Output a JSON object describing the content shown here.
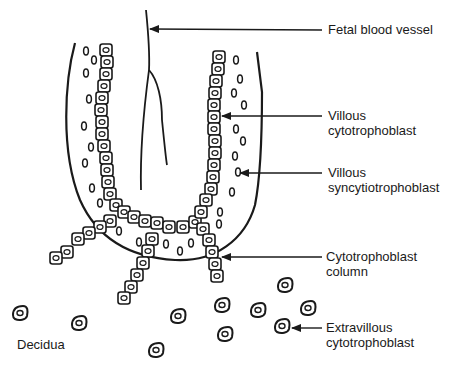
{
  "diagram": {
    "title": "",
    "colors": {
      "ink": "#1a1a1a",
      "background": "#ffffff"
    },
    "labels": {
      "fetal_blood_vessel": "Fetal blood vessel",
      "villous_cytotrophoblast": "Villous\ncytotrophoblast",
      "villous_syncytiotrophoblast": "Villous\nsyncytiotrophoblast",
      "cytotrophoblast_column": "Cytotrophoblast\ncolumn",
      "extravillous_cytotrophoblast": "Extravillous\ncytotrophoblast",
      "decidua": "Decidua"
    },
    "structures": [
      "villus-outline",
      "fetal-blood-vessel",
      "cytotrophoblast-layer",
      "syncytiotrophoblast-nuclei",
      "cytotrophoblast-columns",
      "extravillous-cells"
    ]
  }
}
